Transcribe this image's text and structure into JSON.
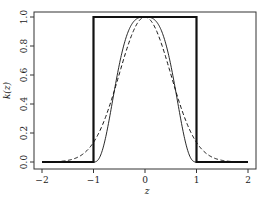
{
  "chart_data": {
    "type": "line",
    "title": "",
    "xlabel": "z",
    "ylabel": "k(z)",
    "xlim": [
      -2,
      2
    ],
    "ylim": [
      0,
      1
    ],
    "grid": false,
    "legend": null,
    "x_ticks": [
      "−2",
      "−1",
      "0",
      "1",
      "2"
    ],
    "x_tick_values": [
      -2,
      -1,
      0,
      1,
      2
    ],
    "y_ticks": [
      "0.0",
      "0.2",
      "0.4",
      "0.6",
      "0.8",
      "1.0"
    ],
    "y_tick_values": [
      0,
      0.2,
      0.4,
      0.6,
      0.8,
      1.0
    ],
    "series": [
      {
        "name": "box",
        "style": "thick-solid",
        "x": [
          -2,
          -1,
          -1,
          1,
          1,
          2
        ],
        "values": [
          0,
          0,
          1,
          1,
          0,
          0
        ]
      },
      {
        "name": "tricube",
        "style": "thin-solid",
        "x": [
          -2,
          -1,
          -0.8,
          -0.6,
          -0.4,
          -0.2,
          0,
          0.2,
          0.4,
          0.6,
          0.8,
          1,
          2
        ],
        "values": [
          0,
          0,
          0.12,
          0.48,
          0.82,
          0.98,
          1,
          0.98,
          0.82,
          0.48,
          0.12,
          0,
          0
        ]
      },
      {
        "name": "gaussian",
        "style": "dashed",
        "x": [
          -2,
          -1.6,
          -1.2,
          -1,
          -0.8,
          -0.6,
          -0.4,
          -0.2,
          0,
          0.2,
          0.4,
          0.6,
          0.8,
          1,
          1.2,
          1.6,
          2
        ],
        "values": [
          0,
          0.01,
          0.06,
          0.14,
          0.28,
          0.49,
          0.73,
          0.92,
          1,
          0.92,
          0.73,
          0.49,
          0.28,
          0.14,
          0.06,
          0.01,
          0
        ]
      }
    ]
  },
  "layout": {
    "plot": {
      "left": 34,
      "top": 12,
      "right": 256,
      "bottom": 169
    },
    "x_px": {
      "min": 42,
      "max": 248
    },
    "y_px": {
      "zero": 162,
      "one": 17
    },
    "colors": {
      "line": "#111111",
      "frame": "#333333",
      "text": "#222222"
    }
  }
}
